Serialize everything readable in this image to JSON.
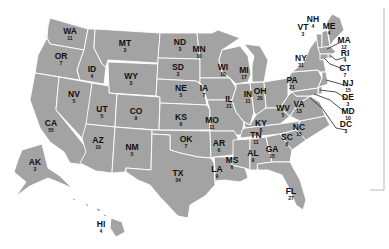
{
  "map": {
    "title": "Electoral votes by state",
    "fill_color": "#a3a3a3",
    "border_color": "#ffffff",
    "label_color": "#111111",
    "states": [
      {
        "abbr": "WA",
        "ev": "11"
      },
      {
        "abbr": "OR",
        "ev": "7"
      },
      {
        "abbr": "CA",
        "ev": "55"
      },
      {
        "abbr": "ID",
        "ev": "4"
      },
      {
        "abbr": "NV",
        "ev": "5"
      },
      {
        "abbr": "MT",
        "ev": "3"
      },
      {
        "abbr": "WY",
        "ev": "3"
      },
      {
        "abbr": "UT",
        "ev": "5"
      },
      {
        "abbr": "AZ",
        "ev": "10"
      },
      {
        "abbr": "CO",
        "ev": "9"
      },
      {
        "abbr": "NM",
        "ev": "5"
      },
      {
        "abbr": "ND",
        "ev": "3"
      },
      {
        "abbr": "SD",
        "ev": "3"
      },
      {
        "abbr": "NE",
        "ev": "5"
      },
      {
        "abbr": "KS",
        "ev": "6"
      },
      {
        "abbr": "OK",
        "ev": "7"
      },
      {
        "abbr": "TX",
        "ev": "34"
      },
      {
        "abbr": "MN",
        "ev": "10"
      },
      {
        "abbr": "IA",
        "ev": "7"
      },
      {
        "abbr": "MO",
        "ev": "11"
      },
      {
        "abbr": "AR",
        "ev": "6"
      },
      {
        "abbr": "LA",
        "ev": "9"
      },
      {
        "abbr": "WI",
        "ev": "10"
      },
      {
        "abbr": "IL",
        "ev": "21"
      },
      {
        "abbr": "MI",
        "ev": "17"
      },
      {
        "abbr": "IN",
        "ev": "11"
      },
      {
        "abbr": "OH",
        "ev": "20"
      },
      {
        "abbr": "KY",
        "ev": "8"
      },
      {
        "abbr": "TN",
        "ev": "11"
      },
      {
        "abbr": "MS",
        "ev": "6"
      },
      {
        "abbr": "AL",
        "ev": "9"
      },
      {
        "abbr": "GA",
        "ev": "15"
      },
      {
        "abbr": "FL",
        "ev": "27"
      },
      {
        "abbr": "SC",
        "ev": "8"
      },
      {
        "abbr": "NC",
        "ev": "15"
      },
      {
        "abbr": "VA",
        "ev": "13"
      },
      {
        "abbr": "WV",
        "ev": "5"
      },
      {
        "abbr": "PA",
        "ev": "21"
      },
      {
        "abbr": "NY",
        "ev": "31"
      },
      {
        "abbr": "VT",
        "ev": "3"
      },
      {
        "abbr": "NH",
        "ev": "4"
      },
      {
        "abbr": "ME",
        "ev": "4"
      },
      {
        "abbr": "MA",
        "ev": "12"
      },
      {
        "abbr": "RI",
        "ev": "4"
      },
      {
        "abbr": "CT",
        "ev": "7"
      },
      {
        "abbr": "NJ",
        "ev": "15"
      },
      {
        "abbr": "DE",
        "ev": "3"
      },
      {
        "abbr": "MD",
        "ev": "10"
      },
      {
        "abbr": "DC",
        "ev": "3"
      },
      {
        "abbr": "AK",
        "ev": "3"
      },
      {
        "abbr": "HI",
        "ev": "4"
      }
    ]
  }
}
